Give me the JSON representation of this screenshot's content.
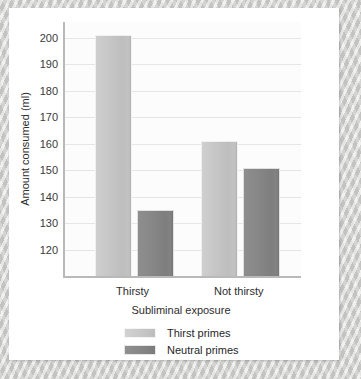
{
  "chart_data": {
    "type": "bar",
    "title": "",
    "xlabel": "Subliminal exposure",
    "ylabel": "Amount consumed (ml)",
    "categories": [
      "Thirsty",
      "Not thirsty"
    ],
    "series": [
      {
        "name": "Thirst primes",
        "values": [
          201,
          161
        ],
        "color": "#c6c6c6"
      },
      {
        "name": "Neutral primes",
        "values": [
          135,
          151
        ],
        "color": "#858585"
      }
    ],
    "ylim": [
      110,
      206
    ],
    "yticks": [
      120,
      130,
      140,
      150,
      160,
      170,
      180,
      190,
      200
    ],
    "ytick_labels": [
      "120",
      "130",
      "140",
      "150",
      "160",
      "170",
      "180",
      "190",
      "200"
    ],
    "grid": true,
    "legend_position": "bottom-center"
  },
  "legend": {
    "entries": [
      {
        "label": "Thirst primes",
        "swatch": "light-grey-swatch"
      },
      {
        "label": "Neutral primes",
        "swatch": "dark-grey-swatch"
      }
    ]
  }
}
